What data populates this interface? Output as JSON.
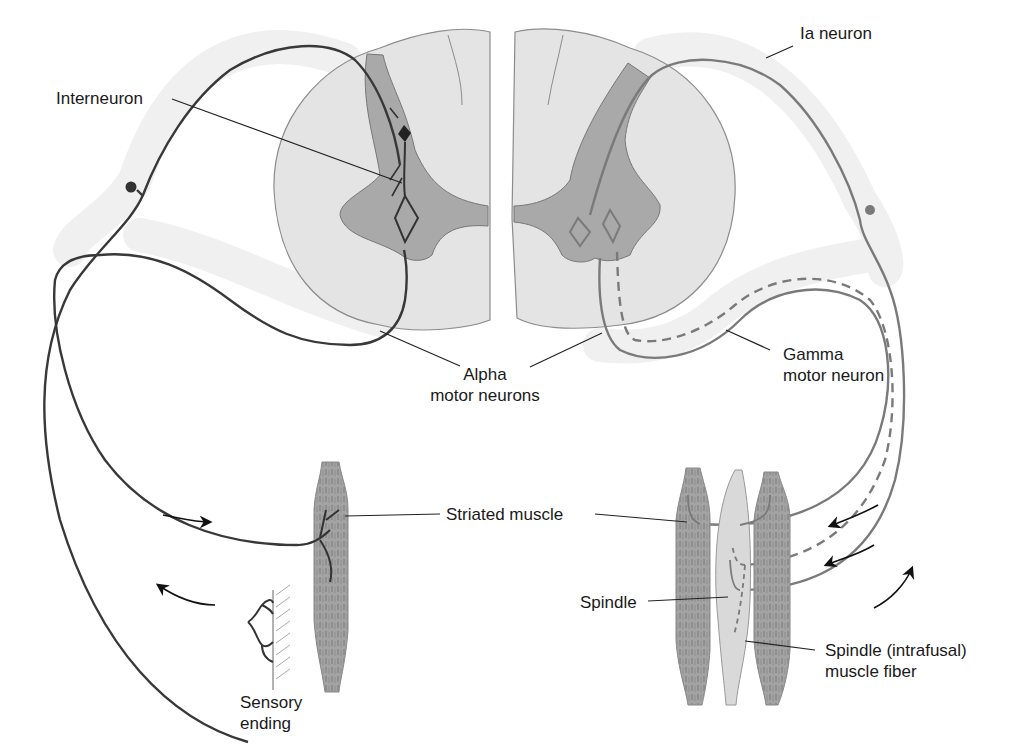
{
  "figure": {
    "type": "anatomical-diagram",
    "colors": {
      "white_matter": "#e6e6e6",
      "gray_matter": "#a9a9a9",
      "nerve_sheath": "#f1f1f1",
      "left_neuron": "#3a3a3a",
      "right_neuron": "#7d7d7d",
      "muscle": "#a0a0a0",
      "spindle": "#d9d9d9",
      "label_text": "#1a1a1a"
    }
  },
  "labels": {
    "interneuron": "Interneuron",
    "ia_neuron": "Ia neuron",
    "alpha_line1": "Alpha",
    "alpha_line2": "motor neurons",
    "gamma_line1": "Gamma",
    "gamma_line2": "motor neuron",
    "striated_muscle": "Striated muscle",
    "spindle": "Spindle",
    "spindle_fiber_line1": "Spindle (intrafusal)",
    "spindle_fiber_line2": "muscle fiber",
    "sensory_line1": "Sensory",
    "sensory_line2": "ending"
  },
  "arrows": {
    "left": [
      "efferent toward muscle (right-pointing)",
      "afferent from sensory ending (left-pointing)"
    ],
    "right": [
      "efferent alpha toward muscle",
      "efferent gamma toward spindle",
      "afferent Ia from spindle (upward)"
    ]
  }
}
